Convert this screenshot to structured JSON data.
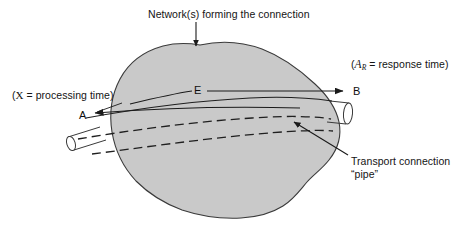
{
  "figure": {
    "background_color": "#ffffff",
    "blob_fill_color": "#c9c9c9",
    "blob_stroke_color": "#3a3a3a",
    "line_color": "#1a1a1a"
  },
  "labels": {
    "network": "Network(s) forming the connection",
    "response_prefix": "(",
    "response_symbol": "A",
    "response_subscript": "R",
    "response_text": " = response time)",
    "processing_prefix": "(",
    "processing_symbol": "X",
    "processing_text": " = processing time)",
    "pipe_line1": "Transport connection",
    "pipe_line2": "“pipe”"
  },
  "nodes": {
    "a": "A",
    "e": "E",
    "b": "B"
  },
  "icons": {
    "network_pointer": "down-arrow-icon",
    "pipe_pointer": "diagonal-arrow-icon",
    "flow_left": "left-arrowhead-icon",
    "flow_right": "right-arrowhead-icon",
    "left_pipe_end": "cylinder-end-icon",
    "right_pipe_end": "cylinder-end-icon"
  }
}
